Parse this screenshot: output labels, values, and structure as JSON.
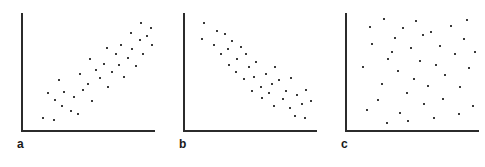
{
  "figure": {
    "background_color": "#ffffff",
    "axis_color": "#2b2b2b",
    "point_color": "#3a3a3a",
    "label_color": "#1a1a1a"
  },
  "panels": [
    {
      "id": "a",
      "label": "a"
    },
    {
      "id": "b",
      "label": "b"
    },
    {
      "id": "c",
      "label": "c"
    }
  ],
  "chart_data": [
    {
      "type": "scatter",
      "title": "a",
      "xlabel": "",
      "ylabel": "",
      "xlim": [
        0,
        100
      ],
      "ylim": [
        0,
        100
      ],
      "grid": false,
      "legend": "none",
      "annotation": "positive correlation",
      "points": [
        [
          15,
          12
        ],
        [
          23,
          10
        ],
        [
          29,
          22
        ],
        [
          24,
          27
        ],
        [
          19,
          33
        ],
        [
          31,
          34
        ],
        [
          27,
          44
        ],
        [
          36,
          18
        ],
        [
          41,
          15
        ],
        [
          38,
          30
        ],
        [
          45,
          36
        ],
        [
          43,
          49
        ],
        [
          52,
          26
        ],
        [
          49,
          41
        ],
        [
          55,
          53
        ],
        [
          58,
          46
        ],
        [
          50,
          62
        ],
        [
          61,
          58
        ],
        [
          64,
          38
        ],
        [
          67,
          51
        ],
        [
          70,
          66
        ],
        [
          63,
          71
        ],
        [
          72,
          57
        ],
        [
          76,
          47
        ],
        [
          79,
          63
        ],
        [
          74,
          74
        ],
        [
          82,
          70
        ],
        [
          85,
          56
        ],
        [
          88,
          78
        ],
        [
          81,
          84
        ],
        [
          90,
          66
        ],
        [
          93,
          81
        ],
        [
          96,
          88
        ],
        [
          89,
          92
        ],
        [
          97,
          74
        ]
      ]
    },
    {
      "type": "scatter",
      "title": "b",
      "xlabel": "",
      "ylabel": "",
      "xlim": [
        0,
        100
      ],
      "ylim": [
        0,
        100
      ],
      "grid": false,
      "legend": "none",
      "annotation": "negative correlation",
      "points": [
        [
          14,
          92
        ],
        [
          13,
          79
        ],
        [
          24,
          86
        ],
        [
          22,
          74
        ],
        [
          30,
          83
        ],
        [
          32,
          70
        ],
        [
          27,
          66
        ],
        [
          35,
          77
        ],
        [
          39,
          62
        ],
        [
          33,
          57
        ],
        [
          42,
          72
        ],
        [
          46,
          66
        ],
        [
          38,
          51
        ],
        [
          48,
          55
        ],
        [
          44,
          45
        ],
        [
          53,
          59
        ],
        [
          52,
          47
        ],
        [
          57,
          38
        ],
        [
          50,
          35
        ],
        [
          61,
          49
        ],
        [
          58,
          29
        ],
        [
          65,
          41
        ],
        [
          68,
          55
        ],
        [
          63,
          33
        ],
        [
          71,
          44
        ],
        [
          74,
          28
        ],
        [
          67,
          22
        ],
        [
          76,
          35
        ],
        [
          80,
          46
        ],
        [
          79,
          20
        ],
        [
          84,
          31
        ],
        [
          88,
          24
        ],
        [
          83,
          14
        ],
        [
          91,
          36
        ],
        [
          90,
          12
        ],
        [
          95,
          26
        ]
      ]
    },
    {
      "type": "scatter",
      "title": "c",
      "xlabel": "",
      "ylabel": "",
      "xlim": [
        0,
        100
      ],
      "ylim": [
        0,
        100
      ],
      "grid": false,
      "legend": "none",
      "annotation": "no correlation",
      "points": [
        [
          17,
          89
        ],
        [
          28,
          96
        ],
        [
          19,
          75
        ],
        [
          12,
          55
        ],
        [
          31,
          62
        ],
        [
          26,
          41
        ],
        [
          23,
          27
        ],
        [
          15,
          19
        ],
        [
          36,
          80
        ],
        [
          42,
          88
        ],
        [
          38,
          52
        ],
        [
          34,
          68
        ],
        [
          45,
          33
        ],
        [
          40,
          16
        ],
        [
          48,
          71
        ],
        [
          52,
          94
        ],
        [
          55,
          60
        ],
        [
          50,
          45
        ],
        [
          58,
          24
        ],
        [
          46,
          9
        ],
        [
          63,
          85
        ],
        [
          67,
          57
        ],
        [
          61,
          39
        ],
        [
          70,
          73
        ],
        [
          65,
          12
        ],
        [
          74,
          48
        ],
        [
          78,
          90
        ],
        [
          72,
          28
        ],
        [
          81,
          66
        ],
        [
          85,
          38
        ],
        [
          88,
          79
        ],
        [
          92,
          54
        ],
        [
          95,
          22
        ],
        [
          84,
          15
        ],
        [
          90,
          95
        ],
        [
          96,
          68
        ],
        [
          57,
          82
        ],
        [
          30,
          8
        ]
      ]
    }
  ]
}
